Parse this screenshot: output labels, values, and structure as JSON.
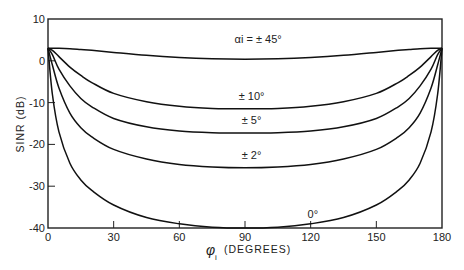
{
  "chart_data": {
    "type": "line",
    "title": "",
    "xlabel": "φi (DEGREES)",
    "xlabel_symbol": "φ",
    "xlabel_sub": "i",
    "xlabel_text": "(DEGREES)",
    "ylabel": "SINR (dB)",
    "xlim": [
      0,
      180
    ],
    "ylim": [
      -40,
      10
    ],
    "xticks": [
      0,
      30,
      60,
      90,
      120,
      150,
      180
    ],
    "yticks": [
      10,
      0,
      -10,
      -20,
      -30,
      -40
    ],
    "xtick_labels": [
      "0",
      "30",
      "60",
      "90",
      "120",
      "150",
      "180"
    ],
    "ytick_labels": [
      "10",
      "0",
      "-10",
      "-20",
      "-30",
      "-40"
    ],
    "grid": false,
    "legend": "none (inline curve annotations)",
    "x": [
      0,
      2,
      5,
      10,
      15,
      20,
      30,
      45,
      60,
      75,
      90,
      105,
      120,
      135,
      150,
      160,
      165,
      170,
      175,
      178,
      180
    ],
    "series": [
      {
        "name": "αi = ±45°",
        "values": [
          3,
          3,
          3,
          2.9,
          2.7,
          2.5,
          2.0,
          1.3,
          0.8,
          0.5,
          0.4,
          0.5,
          0.8,
          1.3,
          2.0,
          2.5,
          2.7,
          2.9,
          3,
          3,
          3
        ]
      },
      {
        "name": "±10°",
        "values": [
          3,
          2.5,
          1.0,
          -1.5,
          -3.5,
          -5.2,
          -7.8,
          -9.8,
          -10.9,
          -11.4,
          -11.5,
          -11.4,
          -10.9,
          -9.8,
          -7.8,
          -5.2,
          -3.5,
          -1.5,
          1.0,
          2.5,
          3
        ]
      },
      {
        "name": "±5°",
        "values": [
          3,
          1.5,
          -2.0,
          -6.0,
          -9.0,
          -11.0,
          -13.8,
          -15.8,
          -16.8,
          -17.2,
          -17.3,
          -17.2,
          -16.8,
          -15.8,
          -13.8,
          -11.0,
          -9.0,
          -6.0,
          -2.0,
          1.5,
          3
        ]
      },
      {
        "name": "±2°",
        "values": [
          3,
          -1.0,
          -6.5,
          -12.5,
          -16.0,
          -18.2,
          -21.2,
          -23.5,
          -24.8,
          -25.4,
          -25.6,
          -25.4,
          -24.8,
          -23.5,
          -21.2,
          -18.2,
          -16.0,
          -12.5,
          -6.5,
          -1.0,
          3
        ]
      },
      {
        "name": "0°",
        "values": [
          3,
          -8.0,
          -17.0,
          -24.5,
          -28.5,
          -31.0,
          -34.5,
          -37.5,
          -39.0,
          -39.8,
          -40,
          -39.8,
          -39.0,
          -37.5,
          -34.5,
          -31.0,
          -28.5,
          -24.5,
          -17.0,
          -8.0,
          3
        ]
      }
    ],
    "annotations": [
      {
        "text": "αi = ± 45°",
        "series": 0,
        "x": 96,
        "y": 4.2
      },
      {
        "text": "± 10°",
        "series": 1,
        "x": 93,
        "y": -9.3
      },
      {
        "text": "± 5°",
        "series": 2,
        "x": 93,
        "y": -15.2
      },
      {
        "text": "± 2°",
        "series": 3,
        "x": 93,
        "y": -23.6
      },
      {
        "text": "0°",
        "series": 4,
        "x": 121,
        "y": -37.5
      }
    ]
  }
}
